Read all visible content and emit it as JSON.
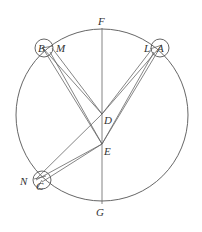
{
  "diagram": {
    "type": "geometric-astronomy",
    "line_color": "#555555",
    "background": "#ffffff",
    "labels": {
      "F": "F",
      "G": "G",
      "D": "D",
      "E": "E",
      "B": "B",
      "M": "M",
      "L": "L",
      "A": "A",
      "N": "N",
      "C": "C"
    },
    "points": [
      {
        "id": "F",
        "role": "top of vertical diameter"
      },
      {
        "id": "G",
        "role": "bottom of vertical diameter"
      },
      {
        "id": "D",
        "role": "centre of main circle"
      },
      {
        "id": "E",
        "role": "point below D on diameter"
      },
      {
        "id": "B",
        "role": "epicycle centre, upper left"
      },
      {
        "id": "M",
        "role": "point on epicycle B"
      },
      {
        "id": "A",
        "role": "epicycle centre, upper right"
      },
      {
        "id": "L",
        "role": "point on epicycle A"
      },
      {
        "id": "C",
        "role": "epicycle centre, lower left"
      },
      {
        "id": "N",
        "role": "point on epicycle C"
      }
    ],
    "segments": [
      [
        "F",
        "G"
      ],
      [
        "D",
        "B"
      ],
      [
        "D",
        "M"
      ],
      [
        "E",
        "B"
      ],
      [
        "E",
        "M"
      ],
      [
        "D",
        "A"
      ],
      [
        "D",
        "L"
      ],
      [
        "E",
        "A"
      ],
      [
        "E",
        "L"
      ],
      [
        "D",
        "N"
      ],
      [
        "E",
        "N"
      ],
      [
        "E",
        "C"
      ]
    ]
  }
}
